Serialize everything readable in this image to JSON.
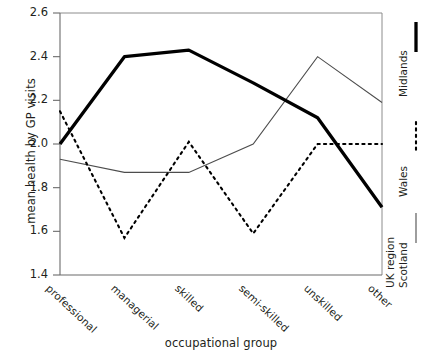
{
  "chart_data": {
    "type": "line",
    "title": "",
    "xlabel": "occupational group",
    "ylabel": "mean health by GP visits",
    "categories": [
      "professional",
      "managerial",
      "skilled",
      "semi-skilled",
      "unskilled",
      "other"
    ],
    "ylim": [
      1.4,
      2.6
    ],
    "yticks": [
      "1.4",
      "1.6",
      "1.8",
      "2.0",
      "2.2",
      "2.4",
      "2.6"
    ],
    "ytick_values": [
      1.4,
      1.6,
      1.8,
      2.0,
      2.2,
      2.4,
      2.6
    ],
    "grid": false,
    "legend_position": "right-outside-vertical",
    "legend_title": "UK region",
    "series": [
      {
        "name": "Scotland",
        "style": "thin-solid",
        "color": "#4d4d4d",
        "values": [
          1.93,
          1.87,
          1.87,
          2.0,
          2.4,
          2.19
        ]
      },
      {
        "name": "Wales",
        "style": "dashed",
        "color": "#000000",
        "values": [
          2.15,
          1.57,
          2.01,
          1.59,
          2.0,
          2.0
        ]
      },
      {
        "name": "Midlands",
        "style": "thick-solid",
        "color": "#000000",
        "values": [
          2.0,
          2.4,
          2.43,
          2.28,
          2.12,
          1.71
        ]
      }
    ]
  },
  "axis": {
    "y_title": "mean health by GP visits",
    "x_title": "occupational group"
  },
  "legend": {
    "title": "UK region",
    "items": [
      {
        "label": "Scotland",
        "sample": "thin-solid-line-sample"
      },
      {
        "label": "Wales",
        "sample": "dashed-line-sample"
      },
      {
        "label": "Midlands",
        "sample": "thick-solid-line-sample"
      }
    ]
  },
  "ticks": {
    "y": [
      "2.6",
      "2.4",
      "2.2",
      "2.0",
      "1.8",
      "1.6",
      "1.4"
    ],
    "x": [
      "professional",
      "managerial",
      "skilled",
      "semi-skilled",
      "unskilled",
      "other"
    ]
  }
}
